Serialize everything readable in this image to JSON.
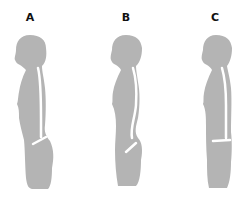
{
  "figures": [
    {
      "label": "A",
      "description": "posture with flattened lower back, pelvis tilted backward"
    },
    {
      "label": "B",
      "description": "posture with increased lumbar curve, pelvis tilted forward"
    },
    {
      "label": "C",
      "description": "neutral posture, straight spine, level pelvis"
    }
  ],
  "colors": {
    "silhouette": "#b4b4b4",
    "spine": "#ffffff",
    "label": "#111111",
    "background": "#ffffff"
  }
}
